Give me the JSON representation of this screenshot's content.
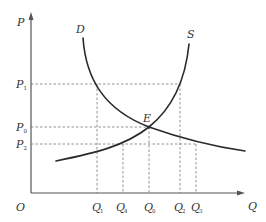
{
  "diagram": {
    "type": "supply-demand",
    "axes": {
      "y_label": "P",
      "x_label": "Q",
      "origin_label": "O"
    },
    "curves": {
      "demand": {
        "label": "D"
      },
      "supply": {
        "label": "S"
      }
    },
    "equilibrium": {
      "label": "E"
    },
    "price_levels": [
      {
        "main": "P",
        "sub": "1"
      },
      {
        "main": "P",
        "sub": "0"
      },
      {
        "main": "P",
        "sub": "2"
      }
    ],
    "quantity_levels": [
      {
        "main": "Q",
        "sub": "1"
      },
      {
        "main": "Q",
        "sub": "4"
      },
      {
        "main": "Q",
        "sub": "0"
      },
      {
        "main": "Q",
        "sub": "2"
      },
      {
        "main": "Q",
        "sub": "3"
      }
    ],
    "colors": {
      "curve": "#2a2a2a",
      "axis": "#555555",
      "guide": "#777777"
    }
  }
}
